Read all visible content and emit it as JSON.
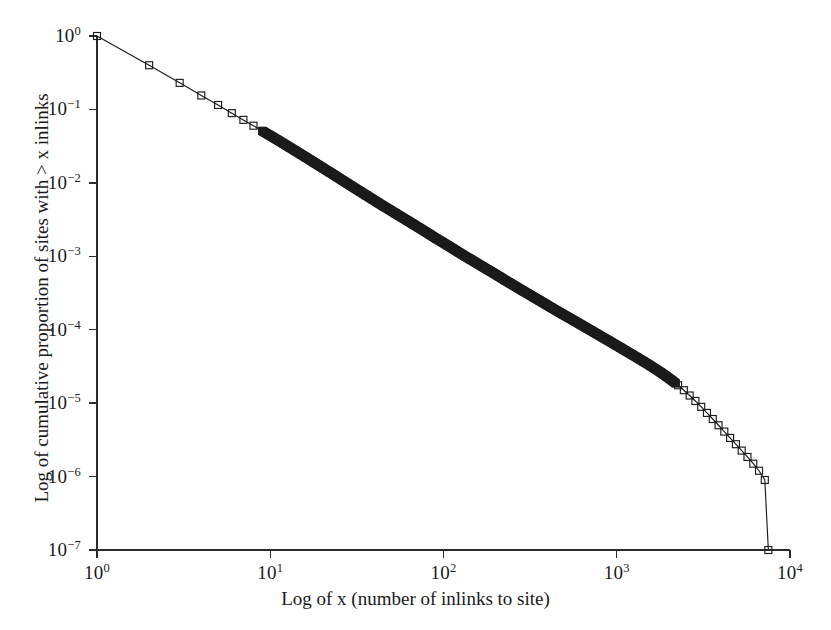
{
  "figure": {
    "width": 831,
    "height": 630,
    "background": "#ffffff",
    "ink_color": "#1c1c1c"
  },
  "axes": {
    "x_title": "Log of x (number of inlinks to site)",
    "y_title": "Log of cumulative proportion of sites with > x inlinks",
    "x_tick_labels": [
      "10",
      "10",
      "10",
      "10",
      "10"
    ],
    "x_tick_exponents": [
      "0",
      "1",
      "2",
      "3",
      "4"
    ],
    "y_tick_labels": [
      "10",
      "10",
      "10",
      "10",
      "10",
      "10",
      "10",
      "10"
    ],
    "y_tick_exponents": [
      "0",
      "−1",
      "−2",
      "−3",
      "−4",
      "−5",
      "−6",
      "−7"
    ],
    "frame": "left-and-bottom-spines",
    "tick_direction": "outward",
    "grid": false
  },
  "caption": {
    "partial_bottom_text": ""
  },
  "chart_data": {
    "type": "line",
    "title": "",
    "subtitle": "",
    "xlabel": "Log of x (number of inlinks to site)",
    "ylabel": "Log cumulative proportion of sites with > x inlinks",
    "xscale": "log",
    "yscale": "log",
    "xlim": [
      1,
      10000
    ],
    "ylim": [
      1e-07,
      1
    ],
    "grid": false,
    "legend": null,
    "marker": "open-square",
    "marker_size_px": 7,
    "line_color": "#1c1c1c",
    "series": [
      {
        "name": "cumulative proportion of sites with > x inlinks",
        "x": [
          1,
          2,
          3,
          4,
          5,
          6,
          7,
          8,
          9,
          10,
          11,
          12,
          13,
          14,
          15,
          16,
          17,
          18,
          19,
          20,
          22,
          24,
          26,
          28,
          30,
          33,
          36,
          39,
          42,
          45,
          49,
          53,
          57,
          62,
          67,
          72,
          78,
          84,
          91,
          98,
          106,
          114,
          123,
          133,
          143,
          155,
          167,
          180,
          195,
          210,
          227,
          245,
          264,
          285,
          308,
          332,
          359,
          387,
          418,
          451,
          487,
          526,
          568,
          613,
          662,
          715,
          772,
          833,
          900,
          971,
          1049,
          1132,
          1223,
          1320,
          1426,
          1539,
          1662,
          1795,
          1938,
          2093,
          2260,
          2440,
          2635,
          2845,
          3072,
          3317,
          3582,
          3868,
          4177,
          4511,
          4872,
          5262,
          5682,
          6136,
          6627,
          7155,
          7500
        ],
        "y": [
          1.0,
          0.4,
          0.23,
          0.155,
          0.115,
          0.089,
          0.072,
          0.06,
          0.051,
          0.044,
          0.0385,
          0.034,
          0.0303,
          0.0272,
          0.0246,
          0.0224,
          0.0205,
          0.0188,
          0.0174,
          0.0161,
          0.014,
          0.0123,
          0.0109,
          0.00975,
          0.0088,
          0.00765,
          0.00672,
          0.00597,
          0.00535,
          0.00483,
          0.00428,
          0.00382,
          0.00344,
          0.00305,
          0.00273,
          0.00246,
          0.00219,
          0.00196,
          0.00174,
          0.00157,
          0.0014,
          0.00126,
          0.001125,
          0.001005,
          0.00091,
          0.000812,
          0.00073,
          0.000657,
          0.000588,
          0.000528,
          0.000472,
          0.000424,
          0.000382,
          0.000342,
          0.000308,
          0.000277,
          0.000249,
          0.000224,
          0.000201,
          0.000181,
          0.000163,
          0.000147,
          0.0001325,
          0.0001193,
          0.0001074,
          9.67e-05,
          8.7e-05,
          7.83e-05,
          7.05e-05,
          6.34e-05,
          5.7e-05,
          5.12e-05,
          4.6e-05,
          4.13e-05,
          3.7e-05,
          3.31e-05,
          2.95e-05,
          2.62e-05,
          2.31e-05,
          2.02e-05,
          1.75e-05,
          1.5e-05,
          1.27e-05,
          1.07e-05,
          8.9e-06,
          7.36e-06,
          6.08e-06,
          5e-06,
          4.1e-06,
          3.36e-06,
          2.76e-06,
          2.26e-06,
          1.85e-06,
          1.5e-06,
          1.2e-06,
          9e-07,
          1e-07
        ]
      }
    ],
    "reference_readings": [
      {
        "x": 1,
        "y": 1.0
      },
      {
        "x": 10,
        "y": 0.026
      },
      {
        "x": 100,
        "y": 0.0014
      },
      {
        "x": 1000,
        "y": 6.6e-05
      },
      {
        "x": 7500,
        "y": 1e-07
      }
    ]
  }
}
